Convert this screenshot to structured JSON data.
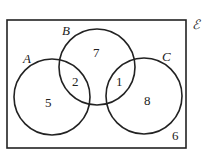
{
  "diagram": {
    "type": "venn",
    "universal_label": "ℰ",
    "sets": [
      {
        "name": "A"
      },
      {
        "name": "B"
      },
      {
        "name": "C"
      }
    ],
    "regions": {
      "A_only": "5",
      "A_and_B": "2",
      "B_only": "7",
      "B_and_C": "1",
      "C_only": "8",
      "outside": "6"
    }
  }
}
